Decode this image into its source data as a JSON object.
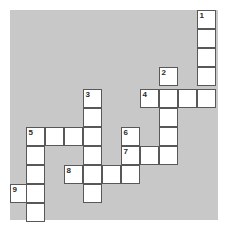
{
  "puzzle": {
    "type": "crossword-grid",
    "title": "Crossword puzzle grid",
    "geometry": {
      "cell_size": 19,
      "panel_left": 10,
      "panel_top": 10,
      "panel_width": 208,
      "panel_height": 210,
      "columns_x": [
        10,
        26,
        45,
        64,
        83,
        102,
        121,
        140,
        159,
        178,
        197
      ],
      "rows_y": [
        10,
        29,
        48,
        67,
        89,
        108,
        127,
        146,
        165,
        184,
        203
      ]
    },
    "colors": {
      "panel_background": "#c8c8c8",
      "cell_fill": "#ffffff",
      "cell_border": "#585858",
      "number_text": "#2b2b2b",
      "page_background": "#ffffff"
    },
    "entries": [
      {
        "number": "1",
        "direction": "down",
        "length": 5,
        "start_x": 197,
        "start_y": 10,
        "cells": [
          {
            "x": 197,
            "y": 10
          },
          {
            "x": 197,
            "y": 29
          },
          {
            "x": 197,
            "y": 48
          },
          {
            "x": 197,
            "y": 67
          },
          {
            "x": 197,
            "y": 89
          }
        ]
      },
      {
        "number": "2",
        "direction": "down",
        "length": 5,
        "start_x": 159,
        "start_y": 67,
        "cells": [
          {
            "x": 159,
            "y": 67
          },
          {
            "x": 159,
            "y": 89
          },
          {
            "x": 159,
            "y": 108
          },
          {
            "x": 159,
            "y": 127
          },
          {
            "x": 159,
            "y": 146
          }
        ]
      },
      {
        "number": "3",
        "direction": "down",
        "length": 6,
        "start_x": 83,
        "start_y": 89,
        "cells": [
          {
            "x": 83,
            "y": 89
          },
          {
            "x": 83,
            "y": 108
          },
          {
            "x": 83,
            "y": 127
          },
          {
            "x": 83,
            "y": 146
          },
          {
            "x": 83,
            "y": 165
          },
          {
            "x": 83,
            "y": 184
          }
        ]
      },
      {
        "number": "4",
        "direction": "across",
        "length": 4,
        "start_x": 140,
        "start_y": 89,
        "cells": [
          {
            "x": 140,
            "y": 89
          },
          {
            "x": 159,
            "y": 89
          },
          {
            "x": 178,
            "y": 89
          },
          {
            "x": 197,
            "y": 89
          }
        ]
      },
      {
        "number": "5",
        "direction": "across",
        "length": 4,
        "start_x": 26,
        "start_y": 127,
        "cells": [
          {
            "x": 26,
            "y": 127
          },
          {
            "x": 45,
            "y": 127
          },
          {
            "x": 64,
            "y": 127
          },
          {
            "x": 83,
            "y": 127
          }
        ]
      },
      {
        "number": "5",
        "direction": "down",
        "length": 5,
        "start_x": 26,
        "start_y": 127,
        "cells": [
          {
            "x": 26,
            "y": 127
          },
          {
            "x": 26,
            "y": 146
          },
          {
            "x": 26,
            "y": 165
          },
          {
            "x": 26,
            "y": 184
          },
          {
            "x": 26,
            "y": 203
          }
        ]
      },
      {
        "number": "6",
        "direction": "down",
        "length": 3,
        "start_x": 121,
        "start_y": 127,
        "cells": [
          {
            "x": 121,
            "y": 127
          },
          {
            "x": 121,
            "y": 146
          },
          {
            "x": 121,
            "y": 165
          }
        ]
      },
      {
        "number": "7",
        "direction": "across",
        "length": 3,
        "start_x": 121,
        "start_y": 146,
        "cells": [
          {
            "x": 121,
            "y": 146
          },
          {
            "x": 140,
            "y": 146
          },
          {
            "x": 159,
            "y": 146
          }
        ]
      },
      {
        "number": "8",
        "direction": "across",
        "length": 4,
        "start_x": 64,
        "start_y": 165,
        "cells": [
          {
            "x": 64,
            "y": 165
          },
          {
            "x": 83,
            "y": 165
          },
          {
            "x": 102,
            "y": 165
          },
          {
            "x": 121,
            "y": 165
          }
        ]
      },
      {
        "number": "9",
        "direction": "across",
        "length": 2,
        "start_x": 10,
        "start_y": 184,
        "cells": [
          {
            "x": 10,
            "y": 184
          },
          {
            "x": 26,
            "y": 184
          }
        ]
      }
    ],
    "cells": [
      {
        "x": 197,
        "y": 10,
        "number": "1"
      },
      {
        "x": 197,
        "y": 29,
        "number": ""
      },
      {
        "x": 197,
        "y": 48,
        "number": ""
      },
      {
        "x": 197,
        "y": 67,
        "number": ""
      },
      {
        "x": 159,
        "y": 67,
        "number": "2"
      },
      {
        "x": 83,
        "y": 89,
        "number": "3"
      },
      {
        "x": 140,
        "y": 89,
        "number": "4"
      },
      {
        "x": 159,
        "y": 89,
        "number": ""
      },
      {
        "x": 178,
        "y": 89,
        "number": ""
      },
      {
        "x": 197,
        "y": 89,
        "number": ""
      },
      {
        "x": 83,
        "y": 108,
        "number": ""
      },
      {
        "x": 159,
        "y": 108,
        "number": ""
      },
      {
        "x": 26,
        "y": 127,
        "number": "5"
      },
      {
        "x": 45,
        "y": 127,
        "number": ""
      },
      {
        "x": 64,
        "y": 127,
        "number": ""
      },
      {
        "x": 83,
        "y": 127,
        "number": ""
      },
      {
        "x": 121,
        "y": 127,
        "number": "6"
      },
      {
        "x": 159,
        "y": 127,
        "number": ""
      },
      {
        "x": 26,
        "y": 146,
        "number": ""
      },
      {
        "x": 83,
        "y": 146,
        "number": ""
      },
      {
        "x": 121,
        "y": 146,
        "number": "7"
      },
      {
        "x": 140,
        "y": 146,
        "number": ""
      },
      {
        "x": 159,
        "y": 146,
        "number": ""
      },
      {
        "x": 26,
        "y": 165,
        "number": ""
      },
      {
        "x": 64,
        "y": 165,
        "number": "8"
      },
      {
        "x": 83,
        "y": 165,
        "number": ""
      },
      {
        "x": 102,
        "y": 165,
        "number": ""
      },
      {
        "x": 121,
        "y": 165,
        "number": ""
      },
      {
        "x": 10,
        "y": 184,
        "number": "9"
      },
      {
        "x": 26,
        "y": 184,
        "number": ""
      },
      {
        "x": 83,
        "y": 184,
        "number": ""
      },
      {
        "x": 26,
        "y": 203,
        "number": ""
      }
    ]
  }
}
